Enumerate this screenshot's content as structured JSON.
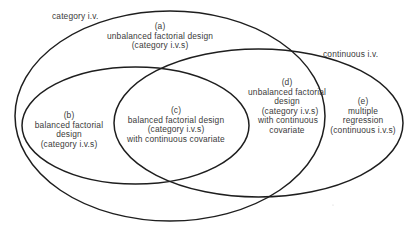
{
  "diagram": {
    "type": "venn",
    "colors": {
      "stroke": "#1e1e1e",
      "text": "#3a3a3a",
      "background": "#ffffff"
    },
    "sets": {
      "category": {
        "label": "category i.v."
      },
      "continuous": {
        "label": "continuous i.v."
      },
      "balanced": {
        "label": ""
      }
    },
    "regions": {
      "a": {
        "id": "(a)",
        "lines": [
          "unbalanced factorial design",
          "(category i.v.s)"
        ]
      },
      "b": {
        "id": "(b)",
        "lines": [
          "balanced factorial",
          "design",
          "(category i.v.s)"
        ]
      },
      "c": {
        "id": "(c)",
        "lines": [
          "balanced factorial design",
          "(category i.v.s)",
          "with continuous covariate"
        ]
      },
      "d": {
        "id": "(d)",
        "lines": [
          "unbalanced factorial",
          "design",
          "(category i.v.s)",
          "with continuous",
          "covariate"
        ]
      },
      "e": {
        "id": "(e)",
        "lines": [
          "multiple",
          "regression",
          "(continuous i.v.s)"
        ]
      }
    }
  }
}
